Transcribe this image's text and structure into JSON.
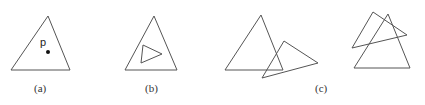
{
  "figure": {
    "panels": [
      {
        "id": "a",
        "label": "(a)",
        "point_label": "p"
      },
      {
        "id": "b",
        "label": "(b)"
      },
      {
        "id": "c",
        "label": "(c)"
      }
    ],
    "stroke_color": "#555555"
  }
}
